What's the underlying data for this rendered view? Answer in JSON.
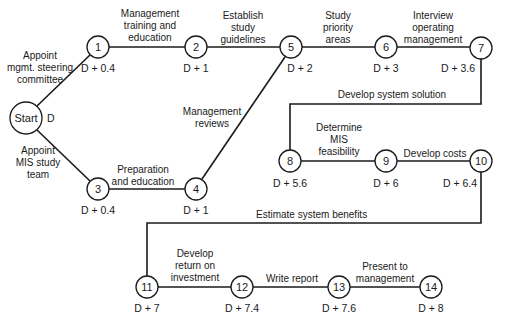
{
  "diagram": {
    "type": "PERT network",
    "nodes": [
      {
        "id": "start",
        "label": "Start",
        "time": "D"
      },
      {
        "id": "1",
        "label": "1",
        "time": "D + 0.4"
      },
      {
        "id": "2",
        "label": "2",
        "time": "D + 1"
      },
      {
        "id": "3",
        "label": "3",
        "time": "D + 0.4"
      },
      {
        "id": "4",
        "label": "4",
        "time": "D + 1"
      },
      {
        "id": "5",
        "label": "5",
        "time": "D + 2"
      },
      {
        "id": "6",
        "label": "6",
        "time": "D + 3"
      },
      {
        "id": "7",
        "label": "7",
        "time": "D + 3.6"
      },
      {
        "id": "8",
        "label": "8",
        "time": "D + 5.6"
      },
      {
        "id": "9",
        "label": "9",
        "time": "D + 6"
      },
      {
        "id": "10",
        "label": "10",
        "time": "D + 6.4"
      },
      {
        "id": "11",
        "label": "11",
        "time": "D + 7"
      },
      {
        "id": "12",
        "label": "12",
        "time": "D + 7.4"
      },
      {
        "id": "13",
        "label": "13",
        "time": "D + 7.6"
      },
      {
        "id": "14",
        "label": "14",
        "time": "D + 8"
      }
    ],
    "activities": [
      {
        "from": "start",
        "to": "1",
        "lines": [
          "Appoint",
          "mgmt. steering",
          "committee"
        ]
      },
      {
        "from": "start",
        "to": "3",
        "lines": [
          "Appoint",
          "MIS study",
          "team"
        ]
      },
      {
        "from": "1",
        "to": "2",
        "lines": [
          "Management",
          "training and",
          "education"
        ]
      },
      {
        "from": "2",
        "to": "5",
        "lines": [
          "Establish",
          "study",
          "guidelines"
        ]
      },
      {
        "from": "3",
        "to": "4",
        "lines": [
          "Preparation",
          "and education"
        ]
      },
      {
        "from": "4",
        "to": "5",
        "lines": [
          "Management",
          "reviews"
        ]
      },
      {
        "from": "5",
        "to": "6",
        "lines": [
          "Study",
          "priority",
          "areas"
        ]
      },
      {
        "from": "6",
        "to": "7",
        "lines": [
          "Interview",
          "operating",
          "management"
        ]
      },
      {
        "from": "7",
        "to": "8",
        "lines": [
          "Develop system solution"
        ]
      },
      {
        "from": "8",
        "to": "9",
        "lines": [
          "Determine",
          "MIS",
          "feasibility"
        ]
      },
      {
        "from": "9",
        "to": "10",
        "lines": [
          "Develop costs"
        ]
      },
      {
        "from": "10",
        "to": "11",
        "lines": [
          "Estimate system benefits"
        ]
      },
      {
        "from": "11",
        "to": "12",
        "lines": [
          "Develop",
          "return on",
          "investment"
        ]
      },
      {
        "from": "12",
        "to": "13",
        "lines": [
          "Write report"
        ]
      },
      {
        "from": "13",
        "to": "14",
        "lines": [
          "Present to",
          "management"
        ]
      }
    ]
  }
}
